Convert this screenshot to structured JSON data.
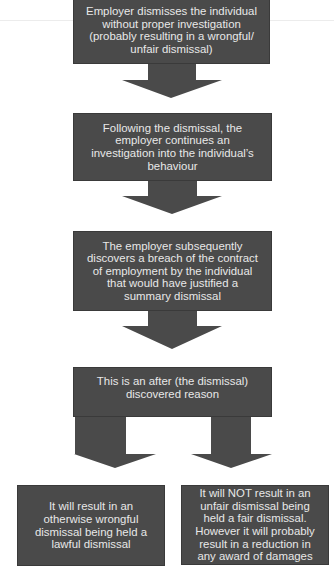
{
  "diagram": {
    "type": "flowchart",
    "box_color": "#4a4a4a",
    "text_color": "#e8e8e8",
    "nodes": [
      {
        "id": "dismissal",
        "text": "Employer dismisses the individual without proper investigation (probably resulting in a wrongful/ unfair dismissal)"
      },
      {
        "id": "investigation",
        "text": "Following the dismissal, the employer continues an investigation into the individual’s behaviour"
      },
      {
        "id": "breach",
        "text": "The employer subsequently discovers a breach of the contract of employment by the individual that would have justified a summary dismissal"
      },
      {
        "id": "after-discovered",
        "text": "This is an after (the dismissal) discovered reason"
      },
      {
        "id": "wrongful-outcome",
        "text": "It will result in an otherwise wrongful dismissal being held a lawful dismissal"
      },
      {
        "id": "unfair-outcome",
        "text": "It will NOT result in an unfair dismissal being held a fair dismissal. However it will probably result in a reduction in any award of damages"
      }
    ],
    "edges": [
      {
        "from": "dismissal",
        "to": "investigation"
      },
      {
        "from": "investigation",
        "to": "breach"
      },
      {
        "from": "breach",
        "to": "after-discovered"
      },
      {
        "from": "after-discovered",
        "to": "wrongful-outcome"
      },
      {
        "from": "after-discovered",
        "to": "unfair-outcome"
      }
    ]
  }
}
